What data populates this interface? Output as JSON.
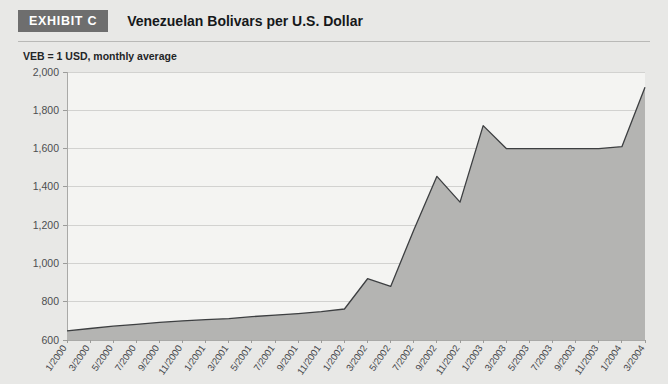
{
  "header": {
    "badge_label": "EXHIBIT C",
    "title": "Venezuelan Bolivars per U.S. Dollar"
  },
  "chart_data": {
    "type": "area",
    "title": "Venezuelan Bolivars per U.S. Dollar",
    "subtitle": "VEB = 1 USD, monthly average",
    "xlabel": "",
    "ylabel": "",
    "ylim": [
      600,
      2000
    ],
    "ytick_labels": [
      "2,000",
      "1,800",
      "1,600",
      "1,400",
      "1,200",
      "1,000",
      "800",
      "600"
    ],
    "ytick_values": [
      2000,
      1800,
      1600,
      1400,
      1200,
      1000,
      800,
      600
    ],
    "grid": true,
    "legend": "none",
    "categories": [
      "1/2000",
      "3/2000",
      "5/2000",
      "7/2000",
      "9/2000",
      "11/2000",
      "1/2001",
      "3/2001",
      "5/2001",
      "7/2001",
      "9/2001",
      "11/2001",
      "1/2002",
      "3/2002",
      "5/2002",
      "7/2002",
      "9/2002",
      "11/2002",
      "1/2003",
      "3/2003",
      "5/2003",
      "7/2003",
      "9/2003",
      "11/2003",
      "1/2004",
      "3/2004"
    ],
    "values": [
      648,
      660,
      672,
      682,
      692,
      700,
      706,
      712,
      722,
      730,
      738,
      748,
      762,
      920,
      880,
      1175,
      1455,
      1320,
      1720,
      1600,
      1600,
      1600,
      1600,
      1600,
      1610,
      1920
    ],
    "series": [
      {
        "name": "VEB per USD",
        "values": [
          648,
          660,
          672,
          682,
          692,
          700,
          706,
          712,
          722,
          730,
          738,
          748,
          762,
          920,
          880,
          1175,
          1455,
          1320,
          1720,
          1600,
          1600,
          1600,
          1600,
          1600,
          1610,
          1920
        ]
      }
    ],
    "colors": {
      "area_fill": "#b4b4b2",
      "line": "#3d3f41",
      "plot_background": "#f4f4f2",
      "gridline": "#d2d2d0",
      "page_background": "#e8e8e6",
      "badge_background": "#6e6e6e",
      "badge_text": "#ffffff"
    }
  }
}
